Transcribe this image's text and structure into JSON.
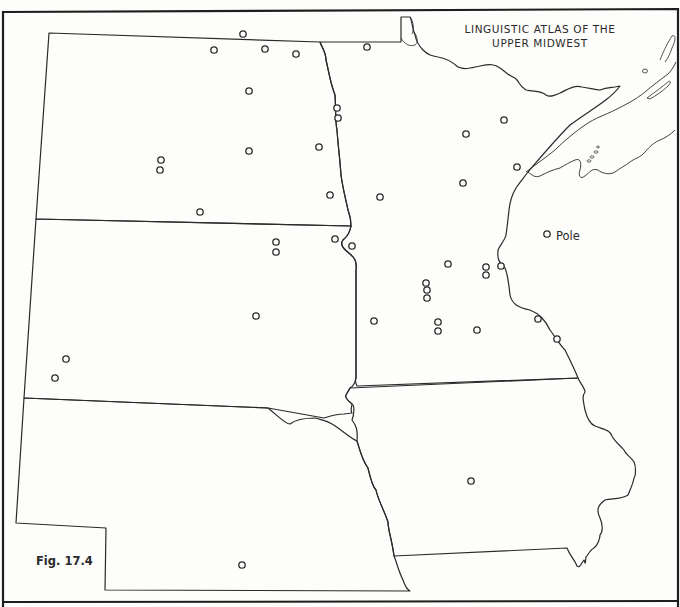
{
  "map": {
    "title_line_1": "LINGUISTIC ATLAS OF THE",
    "title_line_2": "UPPER MIDWEST",
    "figure_label": "Fig. 17.4",
    "region": "Upper Midwest (North Dakota, South Dakota, Nebraska, Minnesota, Iowa)",
    "colors": {
      "background": "#fdfdfb",
      "ink": "#2a2a2a",
      "frame": "#1e1e1e"
    },
    "labeled_points": [
      {
        "label": "Pole",
        "x": 547,
        "y": 234
      }
    ],
    "points": [
      [
        243,
        34
      ],
      [
        214,
        50
      ],
      [
        265,
        49
      ],
      [
        296,
        54
      ],
      [
        367,
        47
      ],
      [
        249,
        91
      ],
      [
        337,
        108
      ],
      [
        338,
        118
      ],
      [
        504,
        120
      ],
      [
        466,
        134
      ],
      [
        161,
        160
      ],
      [
        160,
        170
      ],
      [
        249,
        151
      ],
      [
        319,
        147
      ],
      [
        517,
        167
      ],
      [
        463,
        183
      ],
      [
        330,
        195
      ],
      [
        380,
        197
      ],
      [
        200,
        212
      ],
      [
        276,
        242
      ],
      [
        276,
        252
      ],
      [
        335,
        239
      ],
      [
        352,
        246
      ],
      [
        448,
        264
      ],
      [
        486,
        267
      ],
      [
        486,
        275
      ],
      [
        501,
        266
      ],
      [
        426,
        283
      ],
      [
        427,
        290
      ],
      [
        427,
        298
      ],
      [
        256,
        316
      ],
      [
        374,
        321
      ],
      [
        438,
        322
      ],
      [
        438,
        331
      ],
      [
        477,
        330
      ],
      [
        538,
        319
      ],
      [
        557,
        339
      ],
      [
        66,
        359
      ],
      [
        55,
        378
      ],
      [
        471,
        481
      ],
      [
        242,
        565
      ]
    ]
  }
}
